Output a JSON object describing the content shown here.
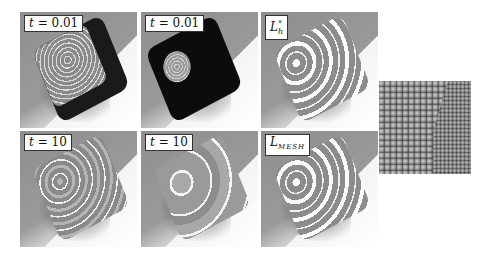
{
  "figure": {
    "panels": [
      {
        "id": "p1",
        "label": "t = 0.01",
        "label_var": "t",
        "label_val": "= 0.01",
        "row": 1,
        "col": 1,
        "cube_tone": "light",
        "contours": "dense-square"
      },
      {
        "id": "p2",
        "label": "t = 0.01",
        "label_var": "t",
        "label_val": "= 0.01",
        "row": 1,
        "col": 2,
        "cube_tone": "dark",
        "contours": "small-circle"
      },
      {
        "id": "p3",
        "label": "L*h",
        "label_var": "L",
        "label_sup": "*",
        "label_sub": "h",
        "row": 1,
        "col": 3,
        "cube_tone": "mid",
        "contours": "wide-circle"
      },
      {
        "id": "p4",
        "label": "t = 10",
        "label_var": "t",
        "label_val": "= 10",
        "row": 2,
        "col": 1,
        "cube_tone": "mid",
        "contours": "wide-circle"
      },
      {
        "id": "p5",
        "label": "t = 10",
        "label_var": "t",
        "label_val": "= 10",
        "row": 2,
        "col": 2,
        "cube_tone": "light",
        "contours": "sparse-circle"
      },
      {
        "id": "p6",
        "label": "L_MESH",
        "label_var": "L",
        "label_sub": "MESH",
        "row": 2,
        "col": 3,
        "cube_tone": "mid",
        "contours": "wide-circle"
      }
    ],
    "inset": {
      "description": "atomic lattice cube"
    }
  }
}
